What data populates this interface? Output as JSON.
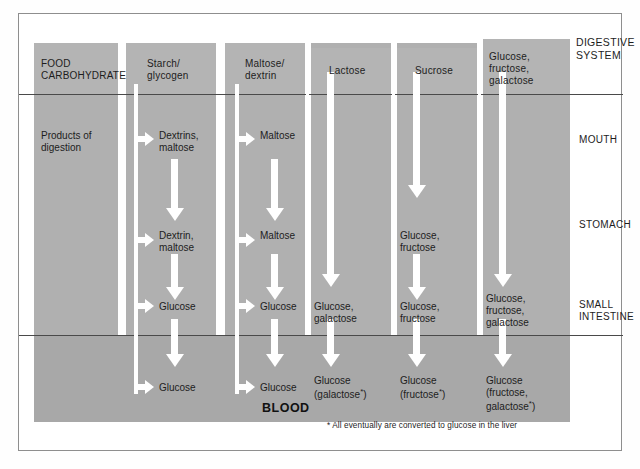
{
  "figure": {
    "side_header": "DIGESTIVE\nSYSTEM",
    "blood_label": "BLOOD",
    "footnote": "* All eventually are converted to glucose in the liver"
  },
  "stages": [
    {
      "name": "mouth",
      "label": "MOUTH"
    },
    {
      "name": "stomach",
      "label": "STOMACH"
    },
    {
      "name": "small-intestine",
      "label": "SMALL\nINTESTINE"
    }
  ],
  "columns": [
    {
      "key": "food-carbohydrate",
      "header": "FOOD\nCARBOHYDRATE",
      "cells": [
        {
          "stage": "mouth",
          "text": "Products of\ndigestion"
        }
      ]
    },
    {
      "key": "starch-glycogen",
      "header": "Starch/\nglycogen",
      "cells": [
        {
          "stage": "mouth",
          "text": "Dextrins,\nmaltose"
        },
        {
          "stage": "stomach",
          "text": "Dextrin,\nmaltose"
        },
        {
          "stage": "small-intestine",
          "text": "Glucose"
        },
        {
          "stage": "blood",
          "text": "Glucose"
        }
      ]
    },
    {
      "key": "maltose-dextrin",
      "header": "Maltose/\ndextrin",
      "cells": [
        {
          "stage": "mouth",
          "text": "Maltose"
        },
        {
          "stage": "stomach",
          "text": "Maltose"
        },
        {
          "stage": "small-intestine",
          "text": "Glucose"
        },
        {
          "stage": "blood",
          "text": "Glucose"
        }
      ]
    },
    {
      "key": "lactose",
      "header": "Lactose",
      "cells": [
        {
          "stage": "small-intestine",
          "text": "Glucose,\ngalactose"
        },
        {
          "stage": "blood",
          "text": "Glucose\n(galactose*)"
        }
      ]
    },
    {
      "key": "sucrose",
      "header": "Sucrose",
      "cells": [
        {
          "stage": "stomach",
          "text": "Glucose,\nfructose"
        },
        {
          "stage": "small-intestine",
          "text": "Glucose,\nfructose"
        },
        {
          "stage": "blood",
          "text": "Glucose\n(fructose*)"
        }
      ]
    },
    {
      "key": "glucose-fructose-galactose",
      "header": "Glucose,\nfructose,\ngalactose",
      "cells": [
        {
          "stage": "small-intestine",
          "text": "Glucose,\nfructose,\ngalactose"
        },
        {
          "stage": "blood",
          "text": "Glucose\n(fructose,\ngalactose*)"
        }
      ]
    }
  ],
  "colors": {
    "panel_gray": "#b0b0b0",
    "blood_gray": "#a8a8a8",
    "arrow_white": "#ffffff",
    "rule_dark": "#4a4a4a",
    "text_dark": "#1d1d1d",
    "frame": "#8e8e8e"
  },
  "cell_text": {
    "c0_mouth": "Products of\ndigestion",
    "c1_mouth": "Dextrins,\nmaltose",
    "c1_stomach": "Dextrin,\nmaltose",
    "c1_si": "Glucose",
    "c1_blood": "Glucose",
    "c2_mouth": "Maltose",
    "c2_stomach": "Maltose",
    "c2_si": "Glucose",
    "c2_blood": "Glucose",
    "c3_si": "Glucose,\ngalactose",
    "c3_blood_a": "Glucose",
    "c3_blood_b": "(galactose",
    "c3_blood_c": ")",
    "c4_stomach": "Glucose,\nfructose",
    "c4_si": "Glucose,\nfructose",
    "c4_blood_a": "Glucose",
    "c4_blood_b": "(fructose",
    "c4_blood_c": ")",
    "c5_si": "Glucose,\nfructose,\ngalactose",
    "c5_blood_a": "Glucose",
    "c5_blood_b": "(fructose,",
    "c5_blood_c": "galactose",
    "c5_blood_d": ")",
    "asterisk": "*"
  },
  "headers": {
    "h0": "FOOD\nCARBOHYDRATE",
    "h1": "Starch/\nglycogen",
    "h2": "Maltose/\ndextrin",
    "h3": "Lactose",
    "h4": "Sucrose",
    "h5": "Glucose,\nfructose,\ngalactose"
  }
}
